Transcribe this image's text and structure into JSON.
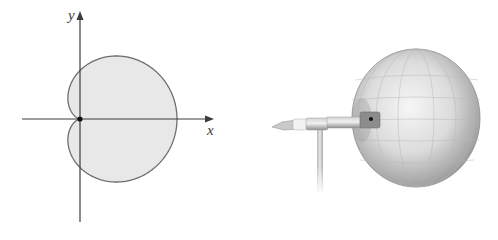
{
  "left_figure": {
    "description": "Cardioid polar curve r = a(1 + cos θ) shaded, with cusp at origin",
    "axis_labels": {
      "x": "x",
      "y": "y"
    },
    "curve": {
      "type": "cardioid",
      "equation": "r = a(1 + cos θ)",
      "fill_color": "#e8e8e8",
      "stroke_color": "#6e6e6e"
    },
    "origin_marker_color": "#111111",
    "axis_color": "#3c3c3c"
  },
  "right_figure": {
    "description": "Microphone on a stand with a cardioid-shaped 3D sound pickup pattern (sphere-like surface)",
    "surface_color": "#d8d8d8",
    "microphone_color": "#b5b5b5"
  },
  "chart_data": {
    "type": "line",
    "title": "",
    "xlabel": "x",
    "ylabel": "y",
    "series": [
      {
        "name": "cardioid r = 1 + cos θ",
        "polar": true,
        "theta_range": [
          0,
          6.2832
        ]
      }
    ],
    "annotations": [
      "origin point marked at cusp"
    ],
    "grid": false
  }
}
